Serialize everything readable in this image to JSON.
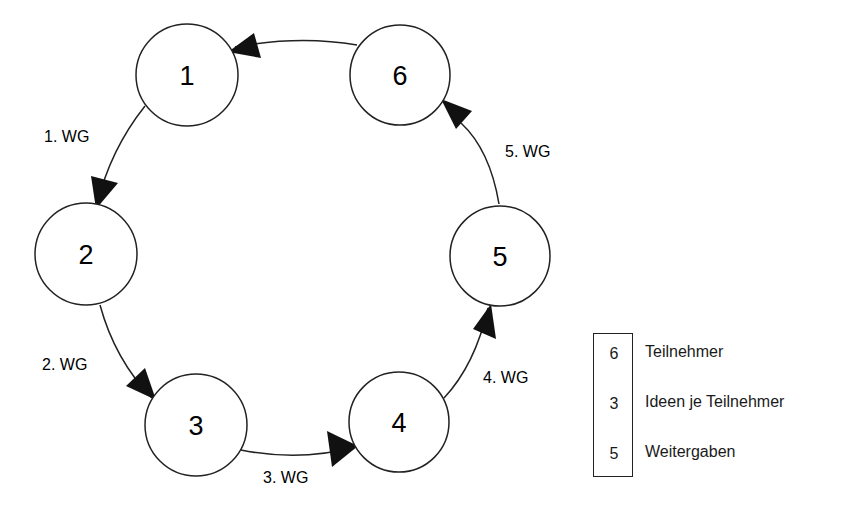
{
  "diagram": {
    "nodes": [
      {
        "id": "1",
        "label": "1",
        "cx": 187,
        "cy": 75
      },
      {
        "id": "2",
        "label": "2",
        "cx": 86,
        "cy": 254
      },
      {
        "id": "3",
        "label": "3",
        "cx": 196,
        "cy": 425
      },
      {
        "id": "4",
        "label": "4",
        "cx": 399,
        "cy": 422
      },
      {
        "id": "5",
        "label": "5",
        "cx": 500,
        "cy": 256
      },
      {
        "id": "6",
        "label": "6",
        "cx": 400,
        "cy": 75
      }
    ],
    "edges": [
      {
        "from": "1",
        "to": "2",
        "label": "1. WG"
      },
      {
        "from": "2",
        "to": "3",
        "label": "2. WG"
      },
      {
        "from": "3",
        "to": "4",
        "label": "3. WG"
      },
      {
        "from": "4",
        "to": "5",
        "label": "4. WG"
      },
      {
        "from": "5",
        "to": "6",
        "label": "5. WG"
      },
      {
        "from": "6",
        "to": "1",
        "label": ""
      }
    ]
  },
  "legend": {
    "items": [
      {
        "value": "6",
        "label": "Teilnehmer"
      },
      {
        "value": "3",
        "label": "Ideen je Teilnehmer"
      },
      {
        "value": "5",
        "label": "Weitergaben"
      }
    ]
  }
}
